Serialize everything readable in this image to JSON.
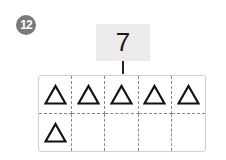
{
  "problem": {
    "number": "12",
    "total": "7",
    "grid": {
      "rows": 2,
      "columns": 5,
      "cells": [
        {
          "mark": "triangle"
        },
        {
          "mark": "triangle"
        },
        {
          "mark": "triangle"
        },
        {
          "mark": "triangle"
        },
        {
          "mark": "triangle"
        },
        {
          "mark": "triangle"
        },
        {
          "mark": ""
        },
        {
          "mark": ""
        },
        {
          "mark": ""
        },
        {
          "mark": ""
        }
      ]
    }
  }
}
